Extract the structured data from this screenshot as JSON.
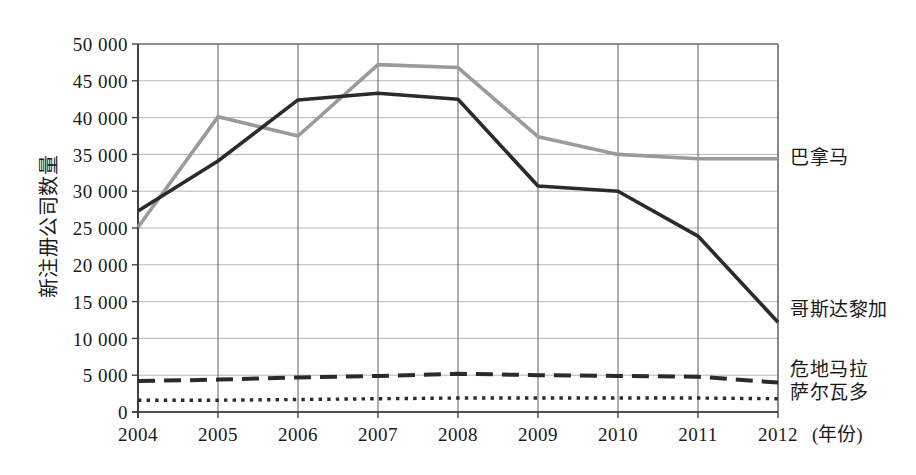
{
  "chart_data": {
    "type": "line",
    "title": "",
    "xlabel": "(年份)",
    "ylabel": "新注册公司数量",
    "x": [
      2004,
      2005,
      2006,
      2007,
      2008,
      2009,
      2010,
      2011,
      2012
    ],
    "categories": [
      "2004",
      "2005",
      "2006",
      "2007",
      "2008",
      "2009",
      "2010",
      "2011",
      "2012"
    ],
    "xlim": [
      2004,
      2012
    ],
    "ylim": [
      0,
      50000
    ],
    "ytick_step": 5000,
    "ytick_labels": [
      "50 000",
      "45 000",
      "40 000",
      "35 000",
      "30 000",
      "25 000",
      "20 000",
      "15 000",
      "10 000",
      "5 000",
      "0"
    ],
    "ytick_values": [
      50000,
      45000,
      40000,
      35000,
      30000,
      25000,
      20000,
      15000,
      10000,
      5000,
      0
    ],
    "grid": "both",
    "legend_position": "right-of-line-ends",
    "series": [
      {
        "name": "巴拿马",
        "color": "#9a9a9a",
        "style": "solid",
        "values": [
          25100,
          40100,
          37500,
          47200,
          46800,
          37400,
          35000,
          34400,
          34400
        ]
      },
      {
        "name": "哥斯达黎加",
        "color": "#2b2b2b",
        "style": "solid",
        "values": [
          27300,
          34100,
          42400,
          43300,
          42500,
          30700,
          30000,
          23900,
          12200
        ]
      },
      {
        "name": "危地马拉",
        "color": "#2b2b2b",
        "style": "dashed",
        "values": [
          4200,
          4400,
          4700,
          4900,
          5200,
          5000,
          4900,
          4800,
          4000
        ]
      },
      {
        "name": "萨尔瓦多",
        "color": "#2b2b2b",
        "style": "dotted",
        "values": [
          1600,
          1600,
          1700,
          1800,
          1900,
          1900,
          1900,
          1900,
          1800
        ]
      }
    ]
  },
  "axes": {
    "y_title": "新注册公司数量",
    "x_unit": "(年份)",
    "y_tick_0": "50 000",
    "y_tick_1": "45 000",
    "y_tick_2": "40 000",
    "y_tick_3": "35 000",
    "y_tick_4": "30 000",
    "y_tick_5": "25 000",
    "y_tick_6": "20 000",
    "y_tick_7": "15 000",
    "y_tick_8": "10 000",
    "y_tick_9": "5 000",
    "y_tick_10": "0",
    "x_tick_0": "2004",
    "x_tick_1": "2005",
    "x_tick_2": "2006",
    "x_tick_3": "2007",
    "x_tick_4": "2008",
    "x_tick_5": "2009",
    "x_tick_6": "2010",
    "x_tick_7": "2011",
    "x_tick_8": "2012"
  },
  "series_labels": {
    "panama": "巴拿马",
    "costa_rica": "哥斯达黎加",
    "guatemala": "危地马拉",
    "el_salvador": "萨尔瓦多"
  },
  "colors": {
    "series_gray": "#9a9a9a",
    "series_black": "#2b2b2b",
    "grid_major": "#6b6b6b",
    "grid_minor": "#b5b5b5",
    "axis": "#3a3a3a",
    "background": "#ffffff"
  }
}
